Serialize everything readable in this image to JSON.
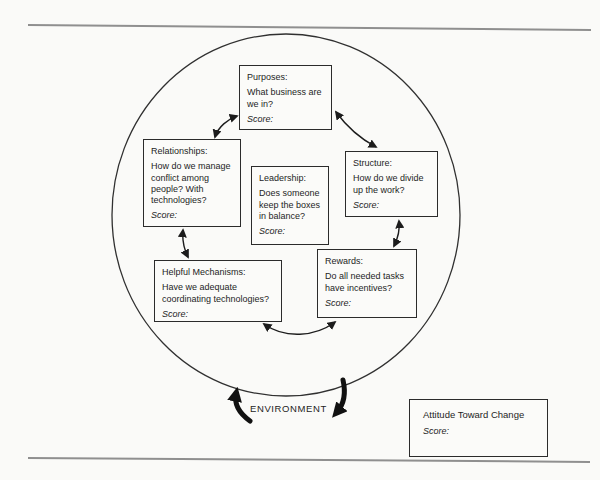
{
  "page": {
    "background": "#fafaf8",
    "rule_color": "#8f8f8f",
    "ink_color": "#1e1e1e"
  },
  "boxes": {
    "purposes": {
      "title": "Purposes:",
      "question": "What business are we in?",
      "score_label": "Score:"
    },
    "relationships": {
      "title": "Relationships:",
      "question": "How do we manage conflict among people? With technologies?",
      "score_label": "Score:"
    },
    "leadership": {
      "title": "Leadership:",
      "question": "Does someone keep the boxes in balance?",
      "score_label": "Score:"
    },
    "structure": {
      "title": "Structure:",
      "question": "How do we divide up the work?",
      "score_label": "Score:"
    },
    "rewards": {
      "title": "Rewards:",
      "question": "Do all needed tasks have incentives?",
      "score_label": "Score:"
    },
    "helpful_mechanisms": {
      "title": "Helpful Mechanisms:",
      "question": "Have we adequate coordinating technologies?",
      "score_label": "Score:"
    }
  },
  "environment": {
    "label": "ENVIRONMENT"
  },
  "attitude_box": {
    "title": "Attitude Toward Change",
    "score_label": "Score:"
  }
}
